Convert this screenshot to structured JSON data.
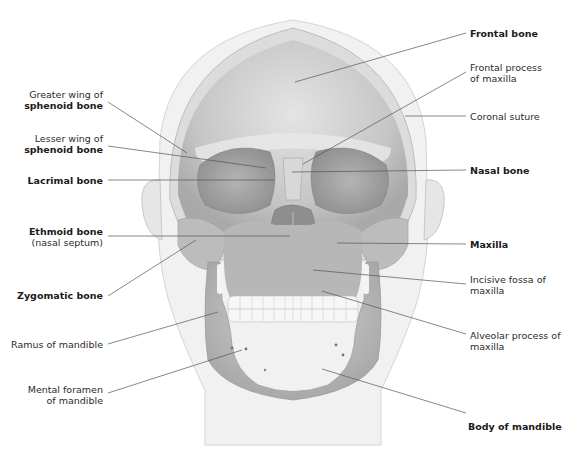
{
  "figure": {
    "colors": {
      "skull_fill": "#c9c9c9",
      "skull_light": "#e2e2e2",
      "skull_dark": "#9a9a9a",
      "head_outline": "#e8e8e8",
      "leader_line": "#555555",
      "text": "#2b2b2b"
    }
  },
  "labels_left": [
    {
      "line1": "Greater wing of",
      "line2": "sphenoid bone",
      "bold_line": 2
    },
    {
      "line1": "Lesser wing of",
      "line2": "sphenoid bone",
      "bold_line": 2
    },
    {
      "line1": "Lacrimal bone",
      "bold_line": 1
    },
    {
      "line1": "Ethmoid bone",
      "line2": "(nasal septum)",
      "bold_line": 1
    },
    {
      "line1": "Zygomatic bone",
      "bold_line": 1
    },
    {
      "line1": "Ramus of mandible"
    },
    {
      "line1": "Mental foramen",
      "line2": "of mandible"
    }
  ],
  "labels_right": [
    {
      "line1": "Frontal bone",
      "bold_line": 1
    },
    {
      "line1": "Frontal process",
      "line2": "of maxilla"
    },
    {
      "line1": "Coronal suture"
    },
    {
      "line1": "Nasal bone",
      "bold_line": 1
    },
    {
      "line1": "Maxilla",
      "bold_line": 1
    },
    {
      "line1": "Incisive fossa of",
      "line2": "maxilla"
    },
    {
      "line1": "Alveolar process of",
      "line2": "maxilla"
    },
    {
      "line1": "Body of mandible",
      "bold_line": 1
    }
  ]
}
